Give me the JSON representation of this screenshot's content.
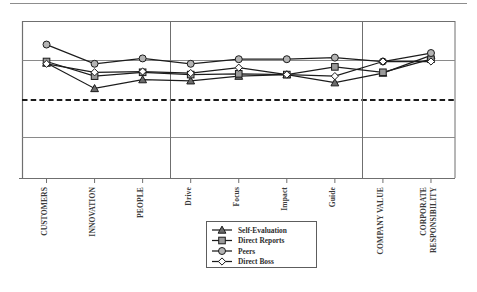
{
  "figure": {
    "top_rule": true,
    "background": "#ffffff",
    "frame_color": "#6f6f6f",
    "grid_color": "#8a8a8a",
    "norm_line_color": "#1b1b1b"
  },
  "chart_data": {
    "type": "line",
    "title": "",
    "subtitle": "",
    "xlabel": "",
    "ylabel": "",
    "grid": true,
    "legend_position": "bottom-center",
    "ylim": [
      1,
      5
    ],
    "yticks": [
      1,
      2,
      3,
      4,
      5
    ],
    "norm_line": 3,
    "categories": [
      "CUSTOMERS",
      "INNOVATION",
      "PEOPLE",
      "Drive",
      "Focus",
      "Impact",
      "Guide",
      "COMPANY VALUE",
      "CORPORATE RESPONSIBILITY"
    ],
    "category_groups": [
      {
        "name": "group-1",
        "members": [
          "CUSTOMERS",
          "INNOVATION",
          "PEOPLE"
        ]
      },
      {
        "name": "group-2",
        "members": [
          "Drive",
          "Focus",
          "Impact",
          "Guide"
        ]
      },
      {
        "name": "group-3",
        "members": [
          "COMPANY VALUE",
          "CORPORATE RESPONSIBILITY"
        ]
      }
    ],
    "series": [
      {
        "name": "Self-Evaluation",
        "marker": "triangle",
        "color": "#1c1c1c",
        "values": [
          3.96,
          3.3,
          3.53,
          3.5,
          3.62,
          3.66,
          3.45,
          3.7,
          4.16
        ]
      },
      {
        "name": "Direct Reports",
        "marker": "square",
        "color": "#1c1c1c",
        "values": [
          4.0,
          3.62,
          3.72,
          3.66,
          3.68,
          3.66,
          3.86,
          3.72,
          4.06
        ]
      },
      {
        "name": "Peers",
        "marker": "circle-filled",
        "color": "#1c1c1c",
        "values": [
          4.44,
          3.94,
          4.08,
          3.94,
          4.06,
          4.06,
          4.1,
          4.0,
          4.22
        ]
      },
      {
        "name": "Direct Boss",
        "marker": "diamond-open",
        "color": "#1c1c1c",
        "values": [
          3.94,
          3.72,
          3.74,
          3.7,
          3.84,
          3.66,
          3.62,
          4.0,
          4.0
        ]
      }
    ]
  },
  "legend": {
    "items": [
      {
        "label": "Self-Evaluation",
        "marker": "triangle"
      },
      {
        "label": "Direct Reports",
        "marker": "square"
      },
      {
        "label": "Peers",
        "marker": "circle-filled"
      },
      {
        "label": "Direct Boss",
        "marker": "diamond-open"
      }
    ]
  },
  "axis": {
    "tick_labels": [
      {
        "text": "CUSTOMERS",
        "style": "caps"
      },
      {
        "text": "INNOVATION",
        "style": "caps"
      },
      {
        "text": "PEOPLE",
        "style": "caps"
      },
      {
        "text": "Drive",
        "style": "mixed"
      },
      {
        "text": "Focus",
        "style": "mixed"
      },
      {
        "text": "Impact",
        "style": "mixed"
      },
      {
        "text": "Guide",
        "style": "mixed"
      },
      {
        "text": "COMPANY VALUE",
        "style": "caps"
      },
      {
        "text": "CORPORATE",
        "style": "caps"
      },
      {
        "text": "RESPONSIBILITY",
        "style": "caps"
      }
    ]
  }
}
